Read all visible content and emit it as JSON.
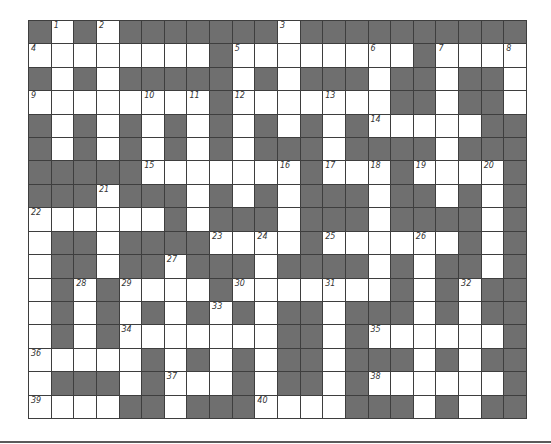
{
  "puzzle": {
    "columns": 22,
    "rows": 17,
    "colors": {
      "block": "#6f6f6f",
      "open": "#ffffff",
      "grid_line": "#3e3e3e"
    },
    "grid": [
      "#.#.#######.##########",
      "........#........#....",
      "#.#.#####.#.###.##.##.",
      "........#.......##.##.",
      "#.#.#.#.#.#.#.#.....##",
      "#.#.#.#.#.###.####.###",
      "#####.......#...#....#",
      "###.###.#.#.###.##.#.#",
      "......#.###.###.####.#",
      ".##.####....#......#.#",
      ".##.##.###.####.#.##.#",
      ".#.#....#.......#.#.##",
      ".#.#.#.#.#.##.###.#.##",
      ".#.#.......##.#......#",
      ".....#.#.#.##.###.#.##",
      ".###.#...#.##.#......#",
      "....##.###....###.#.##"
    ],
    "numbers": [
      {
        "n": "1",
        "r": 0,
        "c": 1
      },
      {
        "n": "2",
        "r": 0,
        "c": 3
      },
      {
        "n": "3",
        "r": 0,
        "c": 11
      },
      {
        "n": "4",
        "r": 1,
        "c": 0
      },
      {
        "n": "5",
        "r": 1,
        "c": 9
      },
      {
        "n": "6",
        "r": 1,
        "c": 15
      },
      {
        "n": "7",
        "r": 1,
        "c": 18
      },
      {
        "n": "8",
        "r": 1,
        "c": 21
      },
      {
        "n": "9",
        "r": 3,
        "c": 0
      },
      {
        "n": "10",
        "r": 3,
        "c": 5
      },
      {
        "n": "11",
        "r": 3,
        "c": 7
      },
      {
        "n": "12",
        "r": 3,
        "c": 9
      },
      {
        "n": "13",
        "r": 3,
        "c": 13
      },
      {
        "n": "14",
        "r": 4,
        "c": 15
      },
      {
        "n": "15",
        "r": 6,
        "c": 5
      },
      {
        "n": "16",
        "r": 6,
        "c": 11
      },
      {
        "n": "17",
        "r": 6,
        "c": 13
      },
      {
        "n": "18",
        "r": 6,
        "c": 15
      },
      {
        "n": "19",
        "r": 6,
        "c": 17
      },
      {
        "n": "20",
        "r": 6,
        "c": 20
      },
      {
        "n": "21",
        "r": 7,
        "c": 3
      },
      {
        "n": "22",
        "r": 8,
        "c": 0
      },
      {
        "n": "23",
        "r": 9,
        "c": 8
      },
      {
        "n": "24",
        "r": 9,
        "c": 10
      },
      {
        "n": "25",
        "r": 9,
        "c": 13
      },
      {
        "n": "26",
        "r": 9,
        "c": 17
      },
      {
        "n": "27",
        "r": 10,
        "c": 6
      },
      {
        "n": "28",
        "r": 11,
        "c": 2
      },
      {
        "n": "29",
        "r": 11,
        "c": 4
      },
      {
        "n": "30",
        "r": 11,
        "c": 9
      },
      {
        "n": "31",
        "r": 11,
        "c": 13
      },
      {
        "n": "32",
        "r": 11,
        "c": 19
      },
      {
        "n": "33",
        "r": 12,
        "c": 8
      },
      {
        "n": "34",
        "r": 13,
        "c": 4
      },
      {
        "n": "35",
        "r": 13,
        "c": 15
      },
      {
        "n": "36",
        "r": 14,
        "c": 0
      },
      {
        "n": "37",
        "r": 15,
        "c": 6
      },
      {
        "n": "38",
        "r": 15,
        "c": 15
      },
      {
        "n": "39",
        "r": 16,
        "c": 0
      },
      {
        "n": "40",
        "r": 16,
        "c": 10
      }
    ]
  }
}
